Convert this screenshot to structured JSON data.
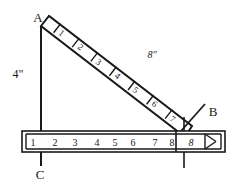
{
  "figure": {
    "vertices": [
      {
        "name": "A",
        "label": "A",
        "x": 38,
        "y": 22
      },
      {
        "name": "B",
        "label": "B",
        "x": 213,
        "y": 116
      },
      {
        "name": "C",
        "label": "C",
        "x": 40,
        "y": 176
      }
    ],
    "dimensions": [
      {
        "name": "vertical-side",
        "label": "4\"",
        "x": 18,
        "y": 74
      },
      {
        "name": "hypotenuse",
        "label": "8\"",
        "x": 152,
        "y": 55
      }
    ],
    "angle": {
      "name": "angle-at-B",
      "label": "8"
    },
    "diagonal_bar": {
      "name": "ladder-bar",
      "ticks": [
        "1",
        "2",
        "3",
        "4",
        "5",
        "6",
        "7"
      ],
      "start": {
        "x": 44,
        "y": 25
      },
      "end": {
        "x": 185,
        "y": 133
      },
      "width": 11
    },
    "ruler": {
      "name": "horizontal-ruler",
      "ticks": [
        "1",
        "2",
        "3",
        "4",
        "5",
        "6",
        "7",
        "8"
      ],
      "angle_cell": "8",
      "left": 22,
      "right": 225,
      "top": 131,
      "bottom": 152
    },
    "colors": {
      "ink": "#1a1a1a",
      "paper": "#ffffff"
    }
  }
}
